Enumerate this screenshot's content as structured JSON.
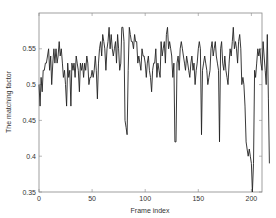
{
  "chart_data": {
    "type": "line",
    "title": "",
    "xlabel": "Frame index",
    "ylabel": "The matching factor",
    "xlim": [
      0,
      210
    ],
    "ylim": [
      0.35,
      0.6
    ],
    "xticks": [
      0,
      50,
      100,
      150,
      200
    ],
    "yticks": [
      0.35,
      0.4,
      0.45,
      0.5,
      0.55
    ],
    "ytick_labels": [
      "0.35",
      "0.4",
      "0.45",
      "0.5",
      "0.55"
    ],
    "xtick_labels": [
      "0",
      "50",
      "100",
      "150",
      "200"
    ],
    "grid": false,
    "legend": null,
    "series": [
      {
        "name": "matching factor",
        "color": "#222222",
        "x_start": 0,
        "x_step": 1,
        "values": [
          0.5,
          0.47,
          0.51,
          0.49,
          0.52,
          0.52,
          0.53,
          0.53,
          0.54,
          0.55,
          0.52,
          0.54,
          0.5,
          0.53,
          0.55,
          0.53,
          0.55,
          0.53,
          0.54,
          0.56,
          0.54,
          0.55,
          0.53,
          0.51,
          0.52,
          0.5,
          0.47,
          0.53,
          0.51,
          0.52,
          0.47,
          0.53,
          0.52,
          0.53,
          0.51,
          0.54,
          0.53,
          0.52,
          0.49,
          0.53,
          0.52,
          0.53,
          0.51,
          0.53,
          0.52,
          0.54,
          0.53,
          0.5,
          0.51,
          0.51,
          0.52,
          0.51,
          0.52,
          0.54,
          0.52,
          0.48,
          0.53,
          0.55,
          0.56,
          0.54,
          0.57,
          0.56,
          0.55,
          0.52,
          0.55,
          0.56,
          0.58,
          0.55,
          0.57,
          0.55,
          0.54,
          0.55,
          0.56,
          0.53,
          0.57,
          0.55,
          0.52,
          0.53,
          0.58,
          0.58,
          0.56,
          0.45,
          0.44,
          0.43,
          0.52,
          0.58,
          0.57,
          0.56,
          0.56,
          0.55,
          0.57,
          0.56,
          0.56,
          0.53,
          0.54,
          0.53,
          0.52,
          0.55,
          0.54,
          0.54,
          0.53,
          0.51,
          0.53,
          0.54,
          0.52,
          0.51,
          0.49,
          0.52,
          0.53,
          0.53,
          0.55,
          0.51,
          0.53,
          0.52,
          0.51,
          0.56,
          0.54,
          0.55,
          0.56,
          0.53,
          0.57,
          0.58,
          0.55,
          0.56,
          0.55,
          0.54,
          0.51,
          0.53,
          0.42,
          0.42,
          0.53,
          0.54,
          0.52,
          0.55,
          0.56,
          0.55,
          0.54,
          0.53,
          0.52,
          0.54,
          0.53,
          0.52,
          0.51,
          0.53,
          0.54,
          0.52,
          0.53,
          0.5,
          0.52,
          0.53,
          0.55,
          0.56,
          0.55,
          0.43,
          0.52,
          0.53,
          0.54,
          0.53,
          0.52,
          0.5,
          0.51,
          0.52,
          0.55,
          0.56,
          0.54,
          0.55,
          0.56,
          0.54,
          0.53,
          0.52,
          0.42,
          0.55,
          0.56,
          0.53,
          0.52,
          0.54,
          0.52,
          0.51,
          0.5,
          0.53,
          0.55,
          0.54,
          0.56,
          0.58,
          0.55,
          0.56,
          0.55,
          0.53,
          0.56,
          0.57,
          0.55,
          0.5,
          0.51,
          0.5,
          0.47,
          0.42,
          0.41,
          0.4,
          0.41,
          0.4,
          0.39,
          0.35,
          0.39,
          0.52,
          0.51,
          0.53,
          0.55,
          0.54,
          0.55,
          0.53,
          0.52,
          0.56,
          0.54,
          0.52,
          0.5,
          0.57,
          0.48,
          0.39
        ]
      }
    ]
  }
}
